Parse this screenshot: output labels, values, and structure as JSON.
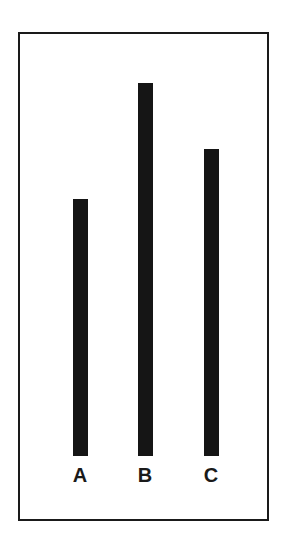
{
  "chart_data": {
    "type": "bar",
    "title": "",
    "xlabel": "",
    "ylabel": "",
    "categories": [
      "A",
      "B",
      "C"
    ],
    "values": [
      257,
      373,
      307
    ],
    "value_units": "relative bar height (pixels, no axis shown)",
    "grid": false,
    "legend": null,
    "bar_color": "#151515",
    "frame": true
  },
  "layout": {
    "baseline_y": 456,
    "bar_width": 15,
    "bar_centers_x": [
      80,
      145,
      211
    ]
  }
}
